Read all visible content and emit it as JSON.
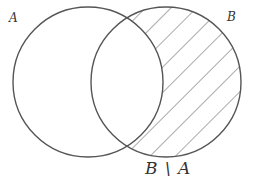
{
  "diagram": {
    "type": "venn",
    "sets": [
      {
        "id": "A",
        "label": "A",
        "cx": 88,
        "cy": 82,
        "r": 75
      },
      {
        "id": "B",
        "label": "B",
        "cx": 166,
        "cy": 82,
        "r": 75
      }
    ],
    "shaded_region": {
      "label": "B \\ A",
      "description": "elements of B not in A",
      "pattern": "diagonal-hatch"
    },
    "colors": {
      "stroke": "#555555",
      "hatch": "#666666",
      "background": "#ffffff"
    }
  }
}
